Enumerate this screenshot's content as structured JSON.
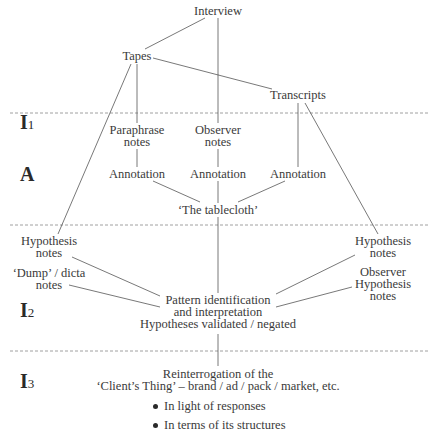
{
  "diagram": {
    "phases": [
      {
        "label": "I",
        "sub": "1"
      },
      {
        "label": "A",
        "sub": ""
      },
      {
        "label": "I",
        "sub": "2"
      },
      {
        "label": "I",
        "sub": "3"
      }
    ],
    "nodes": {
      "interview": [
        "Interview"
      ],
      "tapes": [
        "Tapes"
      ],
      "transcripts": [
        "Transcripts"
      ],
      "paraphrase_notes": [
        "Paraphrase",
        "notes"
      ],
      "observer_notes": [
        "Observer",
        "notes"
      ],
      "annotation_left": [
        "Annotation"
      ],
      "annotation_center": [
        "Annotation"
      ],
      "annotation_right": [
        "Annotation"
      ],
      "tablecloth": [
        "‘The tablecloth’"
      ],
      "hypothesis_notes_left": [
        "Hypothesis",
        "notes"
      ],
      "dump_dicta_notes": [
        "‘Dump’ / dicta",
        "notes"
      ],
      "hypothesis_notes_right": [
        "Hypothesis",
        "notes"
      ],
      "observer_hypothesis_notes": [
        "Observer",
        "Hypothesis",
        "notes"
      ],
      "pattern": [
        "Pattern identification",
        "and interpretation",
        "Hypotheses validated / negated"
      ],
      "reinterrogation": [
        "Reinterrogation of the",
        "‘Client’s Thing’ – brand / ad / pack / market, etc."
      ]
    },
    "bullets": [
      "In light of responses",
      "In terms of its structures"
    ],
    "colors": {
      "line": "#4a4a4a",
      "text": "#3a3a3a",
      "dash": "#7a7a7a"
    }
  }
}
